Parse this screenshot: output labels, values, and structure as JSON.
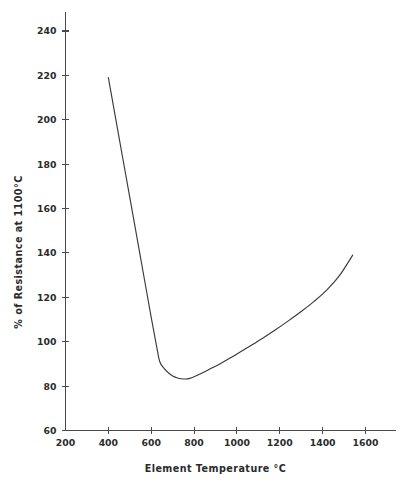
{
  "chart_data": {
    "type": "line",
    "title": "",
    "xlabel": "Element Temperature °C",
    "ylabel": "% of Resistance at 1100°C",
    "xlim": [
      150,
      1700
    ],
    "ylim": [
      60,
      248
    ],
    "grid": false,
    "legend": null,
    "xticks": [
      200,
      400,
      600,
      800,
      1000,
      1200,
      1400,
      1600
    ],
    "xtick_labels": [
      "200",
      "400",
      "600",
      "800",
      "1000",
      "1200",
      "1400",
      "1600"
    ],
    "yticks": [
      60,
      80,
      100,
      120,
      140,
      160,
      180,
      200,
      220,
      240
    ],
    "ytick_labels": [
      "60",
      "80",
      "100",
      "120",
      "140",
      "160",
      "180",
      "200",
      "220",
      "240"
    ],
    "series": [
      {
        "name": "Resistance vs Element Temperature",
        "color": "#3a3a3a",
        "x": [
          400,
          450,
          500,
          550,
          600,
          625,
          640,
          660,
          680,
          700,
          720,
          740,
          760,
          780,
          800,
          840,
          880,
          920,
          960,
          1000,
          1060,
          1120,
          1180,
          1240,
          1300,
          1360,
          1420,
          1480,
          1540
        ],
        "y": [
          219,
          192,
          165,
          138,
          111,
          98,
          91,
          88,
          86,
          84.6,
          83.8,
          83.3,
          83.2,
          83.5,
          84.2,
          86,
          88,
          90,
          92.2,
          94.5,
          98,
          101.6,
          105.4,
          109.4,
          113.6,
          118.2,
          123.4,
          130,
          139
        ]
      }
    ],
    "annotations": [
      {
        "label": "curve-start",
        "x": 400,
        "y": 219
      },
      {
        "label": "curve-minimum",
        "x": 760,
        "y": 83
      },
      {
        "label": "curve-end",
        "x": 1540,
        "y": 139
      }
    ]
  },
  "axes": {
    "x_axis_label": "Element Temperature °C",
    "y_axis_label": "% of Resistance at 1100°C"
  },
  "colors": {
    "background": "#ffffff",
    "axis": "#4a4a4a",
    "curve": "#3a3a3a",
    "text": "#2b2b2b"
  }
}
